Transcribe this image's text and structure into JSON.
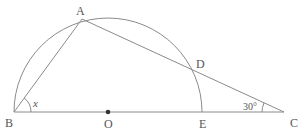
{
  "diagram": {
    "type": "geometry",
    "colors": {
      "stroke": "#8a8a8a",
      "text": "#555555",
      "point": "#333333"
    },
    "points": {
      "A": {
        "label": "A",
        "x": 82,
        "y": 19
      },
      "B": {
        "label": "B",
        "x": 14,
        "y": 112
      },
      "O": {
        "label": "O",
        "x": 108,
        "y": 112
      },
      "E": {
        "label": "E",
        "x": 203,
        "y": 112
      },
      "C": {
        "label": "C",
        "x": 284,
        "y": 112
      },
      "D": {
        "label": "D",
        "x": 194,
        "y": 70
      }
    },
    "segments": [
      "BA",
      "AC",
      "BC"
    ],
    "arc": {
      "center": "O",
      "from": "B",
      "to": "E",
      "radius": 94
    },
    "angles": {
      "x": {
        "label": "x",
        "vertex": "B",
        "between": [
          "BA",
          "BC"
        ]
      },
      "c": {
        "label": "30°",
        "vertex": "C",
        "between": [
          "CA",
          "CB"
        ]
      }
    }
  }
}
